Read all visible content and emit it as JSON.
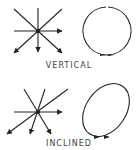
{
  "diagram": {
    "panels": [
      {
        "id": "vertical",
        "caption": "VERTICAL",
        "ray_pattern": "star of polarization vectors, symmetric about vertical axis",
        "orbit_shape": "circle"
      },
      {
        "id": "inclined",
        "caption": "INCLINED",
        "ray_pattern": "star of polarization vectors, skewed/inclined",
        "orbit_shape": "inclined ellipse"
      }
    ],
    "colors": {
      "stroke": "#222222",
      "text": "#444444",
      "background": "#ffffff"
    }
  }
}
